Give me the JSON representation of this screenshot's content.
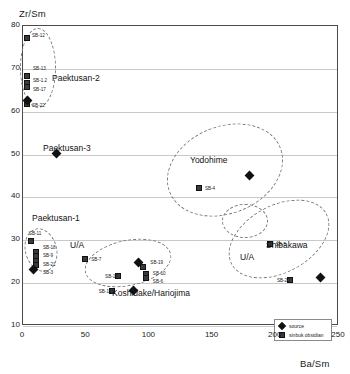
{
  "chart_data": {
    "type": "scatter",
    "title": "",
    "xlabel": "Ba/Sm",
    "ylabel": "Zr/Sm",
    "xlim": [
      0,
      250
    ],
    "ylim": [
      10,
      80
    ],
    "xticks": [
      0,
      50,
      100,
      150,
      200,
      250
    ],
    "yticks": [
      10,
      20,
      30,
      40,
      50,
      60,
      70,
      80
    ],
    "grid": true,
    "legend_position": "bottom-right",
    "legend": [
      {
        "label": "source",
        "marker": "diamond"
      },
      {
        "label": "sinbuk obsidian",
        "marker": "square"
      }
    ],
    "series": [
      {
        "name": "sinbuk obsidian",
        "marker": "square",
        "points": [
          {
            "label": "SB-12",
            "x": 4,
            "y": 77.0
          },
          {
            "label": "SB-13",
            "x": 4,
            "y": 68.0
          },
          {
            "label": "SB-1.2",
            "x": 4,
            "y": 66.5
          },
          {
            "label": "SB-17",
            "x": 4,
            "y": 65.5
          },
          {
            "label": "SB-22",
            "x": 4,
            "y": 61.5
          },
          {
            "label": "SB-11",
            "x": 7,
            "y": 29.5
          },
          {
            "label": "SB-18",
            "x": 11,
            "y": 27.0
          },
          {
            "label": "SB-9",
            "x": 11,
            "y": 26.0
          },
          {
            "label": "SB-21",
            "x": 11,
            "y": 25.0
          },
          {
            "label": "SB-3",
            "x": 11,
            "y": 24.0
          },
          {
            "label": "SB-7",
            "x": 50,
            "y": 25.5
          },
          {
            "label": "SB-15",
            "x": 76,
            "y": 21.5
          },
          {
            "label": "SB-16",
            "x": 71,
            "y": 18.0
          },
          {
            "label": "SB-19",
            "x": 96,
            "y": 23.5
          },
          {
            "label": "SB-10",
            "x": 98,
            "y": 22.0
          },
          {
            "label": "SB-6",
            "x": 98,
            "y": 21.0
          },
          {
            "label": "SB-4",
            "x": 140,
            "y": 42.0
          },
          {
            "label": "SB-5",
            "x": 196,
            "y": 29.0
          },
          {
            "label": "SB-20",
            "x": 212,
            "y": 20.5
          }
        ]
      },
      {
        "name": "source",
        "marker": "diamond",
        "points": [
          {
            "label": "",
            "x": 4,
            "y": 62.5
          },
          {
            "label": "",
            "x": 27,
            "y": 50.0
          },
          {
            "label": "",
            "x": 9,
            "y": 23.0
          },
          {
            "label": "",
            "x": 92,
            "y": 24.5
          },
          {
            "label": "",
            "x": 88,
            "y": 18.0
          },
          {
            "label": "",
            "x": 180,
            "y": 45.0
          },
          {
            "label": "",
            "x": 236,
            "y": 21.0
          }
        ]
      }
    ],
    "cluster_annotations": [
      {
        "name": "Paektusan-2",
        "label": "Paektusan-2"
      },
      {
        "name": "Paektusan-3",
        "label": "Paektusan-3"
      },
      {
        "name": "Paektusan-1",
        "label": "Paektusan-1"
      },
      {
        "name": "U/A-left",
        "label": "U/A"
      },
      {
        "name": "Koshidake/Hariojima",
        "label": "Koshidake/Hariojima"
      },
      {
        "name": "Yodohime",
        "label": "Yodohime"
      },
      {
        "name": "Shibakawa",
        "label": "Shibakawa"
      },
      {
        "name": "U/A-right",
        "label": "U/A"
      }
    ]
  },
  "axes": {
    "y_title": "Zr/Sm",
    "x_title": "Ba/Sm"
  }
}
